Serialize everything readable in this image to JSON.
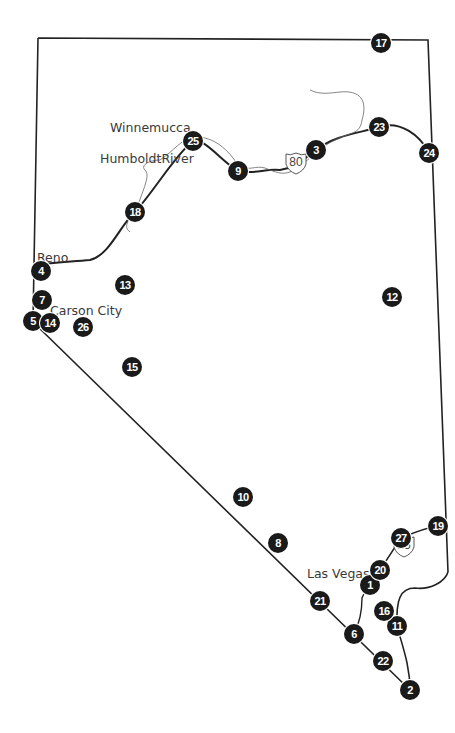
{
  "map": {
    "title": "Nevada",
    "colors": {
      "marker_fill": "#1a1a1a",
      "marker_text": "#ffffff",
      "border": "#222222",
      "road": "#222222",
      "river": "#666666",
      "label": "#3a3a3a"
    },
    "labels": [
      {
        "id": "winnemucca",
        "text": "Winnemucca",
        "x": 110,
        "y": 120
      },
      {
        "id": "humboldt-river",
        "text": "HumboldtRiver",
        "x": 100,
        "y": 151
      },
      {
        "id": "reno",
        "text": "Reno",
        "x": 37,
        "y": 250
      },
      {
        "id": "carson-city",
        "text": "Carson City",
        "x": 50,
        "y": 303
      },
      {
        "id": "las-vegas",
        "text": "Las Vegas",
        "x": 307,
        "y": 566
      }
    ],
    "shields": [
      {
        "id": "i80",
        "text": "80",
        "x": 296,
        "y": 163
      },
      {
        "id": "i15",
        "text": "15",
        "x": 404,
        "y": 546
      }
    ],
    "markers": [
      {
        "n": "1",
        "x": 370,
        "y": 585
      },
      {
        "n": "2",
        "x": 410,
        "y": 690
      },
      {
        "n": "3",
        "x": 316,
        "y": 150
      },
      {
        "n": "4",
        "x": 41,
        "y": 271
      },
      {
        "n": "5",
        "x": 33,
        "y": 321
      },
      {
        "n": "6",
        "x": 354,
        "y": 634
      },
      {
        "n": "7",
        "x": 42,
        "y": 300
      },
      {
        "n": "8",
        "x": 278,
        "y": 543
      },
      {
        "n": "9",
        "x": 238,
        "y": 171
      },
      {
        "n": "10",
        "x": 243,
        "y": 497
      },
      {
        "n": "11",
        "x": 397,
        "y": 626
      },
      {
        "n": "12",
        "x": 392,
        "y": 297
      },
      {
        "n": "13",
        "x": 125,
        "y": 285
      },
      {
        "n": "14",
        "x": 50,
        "y": 323
      },
      {
        "n": "15",
        "x": 132,
        "y": 367
      },
      {
        "n": "16",
        "x": 384,
        "y": 611
      },
      {
        "n": "17",
        "x": 381,
        "y": 43
      },
      {
        "n": "18",
        "x": 135,
        "y": 212
      },
      {
        "n": "19",
        "x": 438,
        "y": 526
      },
      {
        "n": "20",
        "x": 380,
        "y": 570
      },
      {
        "n": "21",
        "x": 320,
        "y": 601
      },
      {
        "n": "22",
        "x": 383,
        "y": 661
      },
      {
        "n": "23",
        "x": 379,
        "y": 127
      },
      {
        "n": "24",
        "x": 429,
        "y": 153
      },
      {
        "n": "25",
        "x": 193,
        "y": 141
      },
      {
        "n": "26",
        "x": 83,
        "y": 327
      },
      {
        "n": "27",
        "x": 401,
        "y": 538
      }
    ]
  }
}
